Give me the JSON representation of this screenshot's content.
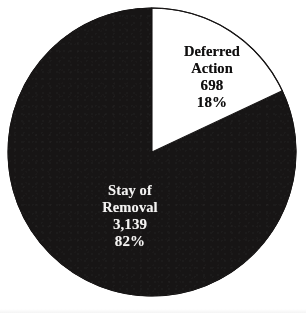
{
  "chart_data": {
    "type": "pie",
    "title": "",
    "xlabel": "",
    "ylabel": "",
    "legend_position": "none",
    "grid": false,
    "labels_inside": true,
    "total": 3837,
    "categories": [
      "Deferred Action",
      "Stay of Removal"
    ],
    "values": [
      698,
      3139
    ],
    "percentages": [
      18,
      82
    ],
    "slices": [
      {
        "name": "Deferred Action",
        "name_line1": "Deferred",
        "name_line2": "Action",
        "value": 698,
        "value_label": "698",
        "percent": 18,
        "percent_label": "18%",
        "fill": "#ffffff",
        "stroke": "#161414",
        "text_color": "#100f0f",
        "start_angle_deg": 0,
        "end_angle_deg": 64.8
      },
      {
        "name": "Stay of Removal",
        "name_line1": "Stay of",
        "name_line2": "Removal",
        "value": 3139,
        "value_label": "3,139",
        "percent": 82,
        "percent_label": "82%",
        "fill": "#171515",
        "stroke": "#171515",
        "text_color": "#f4f3f2",
        "start_angle_deg": 64.8,
        "end_angle_deg": 360
      }
    ],
    "geometry": {
      "center_x": 152,
      "center_y": 152,
      "radius": 144
    }
  },
  "colors": {
    "background": "#ffffff",
    "dark_slice": "#171515",
    "light_slice": "#ffffff",
    "outline": "#161414"
  }
}
